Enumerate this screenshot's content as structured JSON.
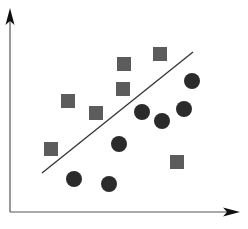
{
  "chart_data": {
    "type": "scatter",
    "title": "",
    "xlabel": "",
    "ylabel": "",
    "grid": false,
    "legend": null,
    "axes": {
      "origin": [
        10,
        212
      ],
      "x_end": [
        240,
        212
      ],
      "y_end": [
        10,
        8
      ],
      "color": "#555555",
      "arrowhead_color": "#111111"
    },
    "series": [
      {
        "name": "squares",
        "marker": "square",
        "color": "#5c5c5c",
        "size": 14,
        "points": [
          {
            "x": 160,
            "y": 54
          },
          {
            "x": 124,
            "y": 64
          },
          {
            "x": 123,
            "y": 89
          },
          {
            "x": 68,
            "y": 101
          },
          {
            "x": 96,
            "y": 113
          },
          {
            "x": 51,
            "y": 149
          },
          {
            "x": 177,
            "y": 162
          }
        ]
      },
      {
        "name": "circles",
        "marker": "circle",
        "color": "#2b2b2b",
        "size": 16,
        "points": [
          {
            "x": 192,
            "y": 81
          },
          {
            "x": 184,
            "y": 109
          },
          {
            "x": 142,
            "y": 112
          },
          {
            "x": 162,
            "y": 121
          },
          {
            "x": 119,
            "y": 144
          },
          {
            "x": 74,
            "y": 179
          },
          {
            "x": 109,
            "y": 184
          }
        ]
      }
    ],
    "separator_line": {
      "x1": 42,
      "y1": 173,
      "x2": 193,
      "y2": 52,
      "color": "#333333",
      "width": 1.3
    },
    "annotations": []
  }
}
